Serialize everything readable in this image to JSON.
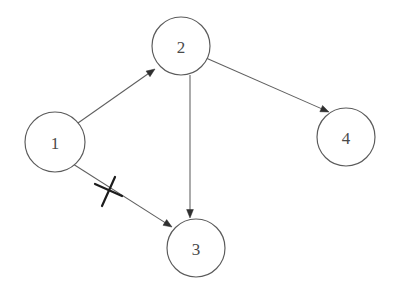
{
  "diagram": {
    "background_color": "#ffffff",
    "node_stroke_color": "#5a5a5a",
    "node_fill_color": "#ffffff",
    "edge_color": "#5f5f5f",
    "arrow_color": "#2f2f2f",
    "label_color": "#4a4a4a",
    "block_mark_color": "#1c1c1c",
    "nodes": [
      {
        "id": "1",
        "label": "1",
        "cx": 55,
        "cy": 142,
        "r": 30
      },
      {
        "id": "2",
        "label": "2",
        "cx": 181,
        "cy": 46,
        "r": 29
      },
      {
        "id": "3",
        "label": "3",
        "cx": 196,
        "cy": 248,
        "r": 29
      },
      {
        "id": "4",
        "label": "4",
        "cx": 346,
        "cy": 137,
        "r": 29
      }
    ],
    "edges": [
      {
        "id": "e1",
        "from": "1",
        "to": "2",
        "x1": 78,
        "y1": 123,
        "x2": 155,
        "y2": 69,
        "arrow": true,
        "blocked": false
      },
      {
        "id": "e2",
        "from": "2",
        "to": "4",
        "x1": 206,
        "y1": 58,
        "x2": 329,
        "y2": 112,
        "arrow": true,
        "blocked": false
      },
      {
        "id": "e3",
        "from": "2",
        "to": "3",
        "x1": 190,
        "y1": 75,
        "x2": 190,
        "y2": 218,
        "arrow": true,
        "blocked": false
      },
      {
        "id": "e4",
        "from": "1",
        "to": "3",
        "x1": 73,
        "y1": 164,
        "x2": 172,
        "y2": 227,
        "arrow": true,
        "blocked": true
      }
    ],
    "block_mark": {
      "id": "block-1-3",
      "on_edge": "e4",
      "cx": 108,
      "cy": 191,
      "stroke1": {
        "x1": 95,
        "y1": 184,
        "x2": 122,
        "y2": 196
      },
      "stroke2": {
        "x1": 115,
        "y1": 177,
        "x2": 102,
        "y2": 206
      }
    }
  }
}
